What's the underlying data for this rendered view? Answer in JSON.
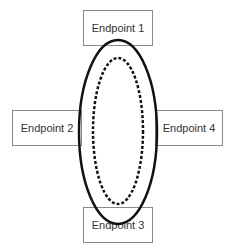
{
  "diagram": {
    "endpoints": [
      {
        "label": "Endpoint 1",
        "position": "top"
      },
      {
        "label": "Endpoint 2",
        "position": "left"
      },
      {
        "label": "Endpoint 3",
        "position": "bottom"
      },
      {
        "label": "Endpoint 4",
        "position": "right"
      }
    ],
    "ring": {
      "outer": "solid",
      "inner": "dashed",
      "color": "#111111"
    }
  }
}
